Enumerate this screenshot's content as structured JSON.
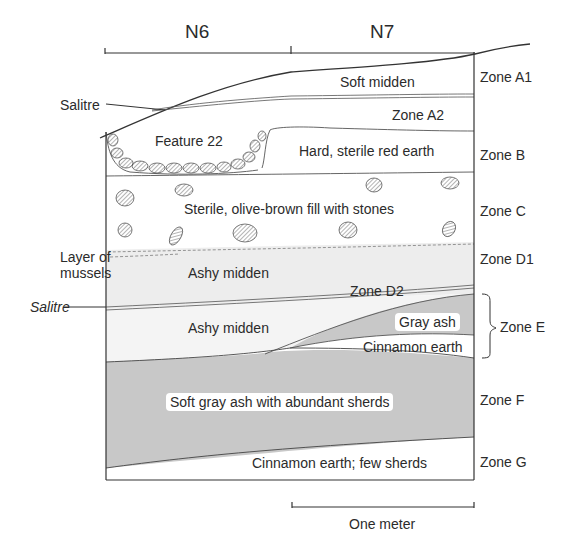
{
  "header": {
    "columns": [
      "N6",
      "N7"
    ]
  },
  "layers": [
    {
      "id": "A1",
      "description": "Soft midden",
      "zone": "Zone A1"
    },
    {
      "id": "A2",
      "description": "",
      "zone": "Zone A2",
      "label_inside": "Zone A2"
    },
    {
      "id": "B",
      "description": "Hard, sterile red earth",
      "zone": "Zone B"
    },
    {
      "id": "feature22",
      "description": "Feature 22"
    },
    {
      "id": "C",
      "description": "Sterile, olive-brown fill with stones",
      "zone": "Zone C"
    },
    {
      "id": "D1",
      "description": "Ashy midden",
      "zone": "Zone D1"
    },
    {
      "id": "D2",
      "description": "Ashy midden",
      "zone": "Zone D2",
      "label_inside": "Zone D2"
    },
    {
      "id": "E_gray",
      "description": "Gray ash"
    },
    {
      "id": "E_cinnamon",
      "description": "Cinnamon earth"
    },
    {
      "id": "E",
      "zone": "Zone E"
    },
    {
      "id": "F",
      "description": "Soft gray ash with abundant sherds",
      "zone": "Zone F"
    },
    {
      "id": "G",
      "description": "Cinnamon earth; few sherds",
      "zone": "Zone G"
    }
  ],
  "annotations": {
    "salitre_top": "Salitre",
    "salitre_mid": "Salitre",
    "mussels_line1": "Layer of",
    "mussels_line2": "mussels"
  },
  "scale": {
    "label": "One meter"
  },
  "colors": {
    "gray_fill": "#c8c8c8",
    "light_fill": "#ededed",
    "line": "#333333"
  }
}
